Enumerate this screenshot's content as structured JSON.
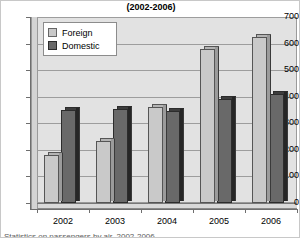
{
  "chart_data": {
    "type": "bar",
    "title": "(2002-2006)",
    "subtitle": "",
    "xlabel": "",
    "ylabel": "",
    "categories": [
      "2002",
      "2003",
      "2004",
      "2005",
      "2006"
    ],
    "series": [
      {
        "name": "Foreign",
        "color": "#c9c9c9",
        "values": [
          180,
          235,
          360,
          580,
          625
        ]
      },
      {
        "name": "Domestic",
        "color": "#696969",
        "values": [
          350,
          355,
          345,
          390,
          410
        ]
      }
    ],
    "ylim": [
      0,
      700
    ],
    "ytick_step": 100,
    "yticks": [
      "700",
      "600",
      "500",
      "400",
      "300",
      "200",
      "100",
      "0"
    ],
    "grid": true,
    "legend_position": "top-left-inside",
    "style": "excel-3d-bar"
  },
  "legend": {
    "items": [
      {
        "label": "Foreign",
        "swatch": "foreign"
      },
      {
        "label": "Domestic",
        "swatch": "domestic"
      }
    ]
  },
  "caption": {
    "text": "Statistics on passengers by air, 2002-2006"
  }
}
